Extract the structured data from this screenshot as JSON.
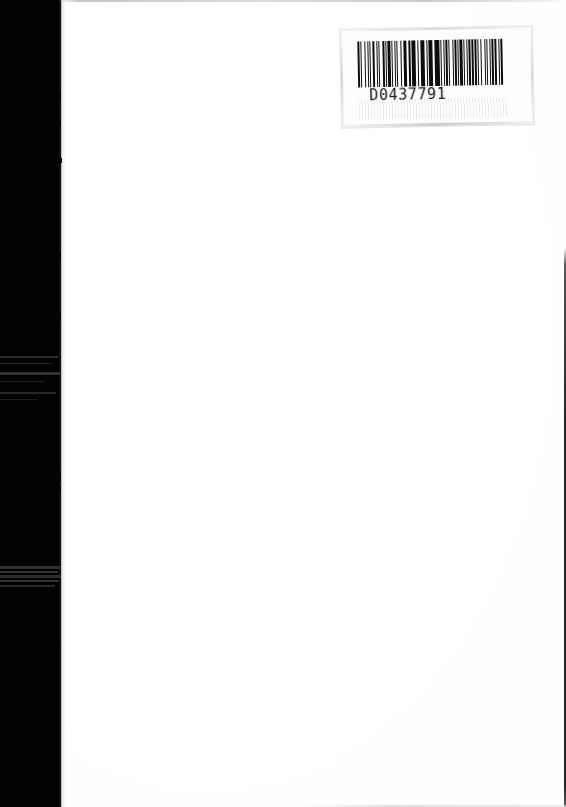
{
  "document": {
    "kind": "scanned-page",
    "page_width": 566,
    "page_height": 807,
    "background_color": "#ffffff",
    "body_text": "",
    "shadow_color": "#020202",
    "ink_color": "#0d0d0d"
  },
  "barcode_label": {
    "human_readable_text": "D0437791",
    "symbology_appearance": "linear-1d-barcode",
    "label_background": "#fdfdfd",
    "bar_color": "#0d0d0d",
    "module_pattern": [
      2,
      2,
      1,
      3,
      2,
      2,
      1,
      2,
      1,
      2,
      3,
      2,
      1,
      2,
      1,
      4,
      2,
      1,
      1,
      2,
      3,
      1,
      2,
      2,
      1,
      2,
      1,
      3,
      2,
      2,
      1,
      1,
      2,
      2,
      3,
      1,
      2,
      1,
      2,
      2,
      1,
      3,
      2,
      1,
      2,
      2,
      1,
      2,
      3,
      1,
      1,
      2,
      2,
      1,
      3,
      2,
      1,
      2,
      1,
      2,
      2,
      1,
      2,
      3,
      1,
      2,
      2,
      1,
      1,
      2,
      3,
      1,
      2,
      2,
      1,
      2,
      2,
      1,
      3,
      1,
      2,
      2,
      1,
      2,
      2,
      3,
      1,
      2,
      1,
      2,
      2,
      1,
      2,
      1,
      3,
      2,
      1,
      2,
      2,
      1
    ]
  },
  "artifacts": {
    "left_shadow_band": {
      "x": 0,
      "width": 61,
      "color": "#020202"
    },
    "streaks": [
      {
        "top": 356,
        "height": 2,
        "width": 58,
        "color": "#2a2a2a"
      },
      {
        "top": 363,
        "height": 1,
        "width": 52,
        "color": "#222222"
      },
      {
        "top": 372,
        "height": 3,
        "width": 60,
        "color": "#303030"
      },
      {
        "top": 381,
        "height": 1,
        "width": 44,
        "color": "#1f1f1f"
      },
      {
        "top": 392,
        "height": 2,
        "width": 56,
        "color": "#272727"
      },
      {
        "top": 399,
        "height": 1,
        "width": 38,
        "color": "#1d1d1d"
      },
      {
        "top": 566,
        "height": 3,
        "width": 60,
        "color": "#2f2f2f"
      },
      {
        "top": 571,
        "height": 2,
        "width": 58,
        "color": "#343434"
      },
      {
        "top": 575,
        "height": 3,
        "width": 61,
        "color": "#2b2b2b"
      },
      {
        "top": 580,
        "height": 2,
        "width": 59,
        "color": "#313131"
      },
      {
        "top": 585,
        "height": 2,
        "width": 55,
        "color": "#262626"
      }
    ],
    "nubs": [
      {
        "left": 56,
        "top": 92,
        "width": 5,
        "height": 8
      },
      {
        "left": 57,
        "top": 120,
        "width": 4,
        "height": 6
      },
      {
        "left": 55,
        "top": 157,
        "width": 7,
        "height": 7
      },
      {
        "left": 57,
        "top": 251,
        "width": 4,
        "height": 9
      },
      {
        "left": 56,
        "top": 312,
        "width": 5,
        "height": 10
      },
      {
        "left": 55,
        "top": 470,
        "width": 6,
        "height": 12
      },
      {
        "left": 57,
        "top": 486,
        "width": 4,
        "height": 7
      },
      {
        "left": 56,
        "top": 640,
        "width": 4,
        "height": 6
      }
    ],
    "top_edge_line": true,
    "right_edge_line": true,
    "bottom_edge_line": true
  }
}
